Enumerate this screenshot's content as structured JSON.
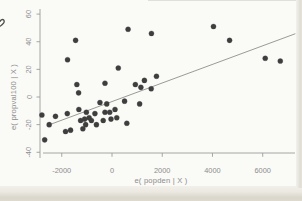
{
  "page": {
    "artifact_note": "ink-mark-top-left"
  },
  "chart_data": {
    "type": "scatter",
    "title": "",
    "xlabel": "e( popden | X )",
    "ylabel": "e( propval100 | X )",
    "x_ticks": [
      -2000,
      0,
      2000,
      4000,
      6000
    ],
    "y_ticks": [
      -40,
      -20,
      0,
      20,
      40,
      60
    ],
    "xlim": [
      -2900,
      7500
    ],
    "ylim": [
      -44,
      62
    ],
    "grid": false,
    "legend_position": "none",
    "point_color": "#3e3e3e",
    "fit_line_color": "#8f8f8f",
    "axis_color": "#9c9c9c",
    "text_color": "#8c8c8c",
    "points": [
      [
        640,
        49
      ],
      [
        1570,
        46
      ],
      [
        4040,
        51
      ],
      [
        4680,
        41
      ],
      [
        6100,
        28
      ],
      [
        6700,
        26
      ],
      [
        -1450,
        41
      ],
      [
        -1770,
        27
      ],
      [
        250,
        21
      ],
      [
        -1400,
        9
      ],
      [
        -280,
        10
      ],
      [
        -1330,
        3
      ],
      [
        930,
        9
      ],
      [
        1290,
        12
      ],
      [
        1770,
        15
      ],
      [
        1150,
        7
      ],
      [
        1560,
        6
      ],
      [
        -480,
        -4
      ],
      [
        -210,
        -5
      ],
      [
        500,
        -3
      ],
      [
        1100,
        -5
      ],
      [
        -1020,
        -11
      ],
      [
        -680,
        -12
      ],
      [
        -280,
        -11
      ],
      [
        -90,
        -11
      ],
      [
        120,
        -9
      ],
      [
        -1090,
        -16
      ],
      [
        -820,
        -17
      ],
      [
        -350,
        -17
      ],
      [
        -40,
        -16
      ],
      [
        190,
        -15
      ],
      [
        590,
        -19
      ],
      [
        -2790,
        -13
      ],
      [
        -2250,
        -14
      ],
      [
        -2500,
        -20
      ],
      [
        -1780,
        -12
      ],
      [
        -1320,
        -9
      ],
      [
        -1650,
        -24
      ],
      [
        -1250,
        -17
      ],
      [
        -1050,
        -20
      ],
      [
        -910,
        -15
      ],
      [
        -2680,
        -31
      ],
      [
        -1850,
        -25
      ],
      [
        -1160,
        -23
      ],
      [
        -620,
        -20
      ]
    ],
    "fit_line": {
      "x1": -2600,
      "y1": -20.8,
      "x2": 7300,
      "y2": 45.8
    }
  }
}
